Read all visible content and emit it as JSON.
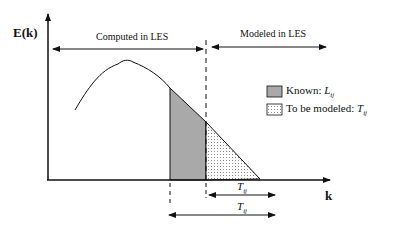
{
  "axes": {
    "y_label": "E(k)",
    "x_label": "k"
  },
  "regions": {
    "computed_label": "Computed in LES",
    "modeled_label": "Modeled in LES"
  },
  "legend": {
    "known_prefix": "Known: ",
    "known_symbol": "L",
    "known_sub": "ij",
    "tobe_prefix": "To be modeled: ",
    "tobe_symbol": "T",
    "tobe_sub": "ij"
  },
  "brackets": {
    "small_symbol": "T",
    "small_sub": "ij",
    "large_symbol": "T",
    "large_sub": "ij"
  },
  "colors": {
    "known_fill": "#a9a9a9",
    "dot": "#8a8a8a",
    "line": "#111111"
  }
}
